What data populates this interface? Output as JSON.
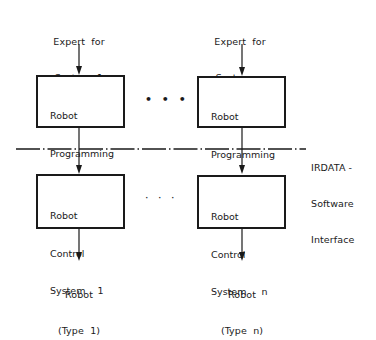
{
  "diagram": {
    "type": "block-diagram",
    "columns": [
      {
        "id": "system-1",
        "expert_label_line1": "Expert  for",
        "expert_label_line2": "System  1",
        "programming_box": {
          "line1": "Robot",
          "line2": "Programming",
          "line3": "System   1"
        },
        "control_box": {
          "line1": "Robot",
          "line2": "Control",
          "line3": "System    1"
        },
        "robot_label_line1": "Robot",
        "robot_label_line2": "(Type  1)"
      },
      {
        "id": "system-n",
        "expert_label_line1": "Expert  for",
        "expert_label_line2": "System  n",
        "programming_box": {
          "line1": "Robot",
          "line2": "Programming",
          "line3": "System    n"
        },
        "control_box": {
          "line1": "Robot",
          "line2": "Control",
          "line3": "System     n"
        },
        "robot_label_line1": "Robot",
        "robot_label_line2": "(Type  n)"
      }
    ],
    "ellipsis_top": "• • •",
    "ellipsis_bottom": "· · ·",
    "interface": {
      "line1": "IRDATA -",
      "line2": "Software",
      "line3": "Interface",
      "line_style": "dash-dot"
    },
    "colors": {
      "ink": "#1a1a1a",
      "background": "#ffffff"
    }
  }
}
